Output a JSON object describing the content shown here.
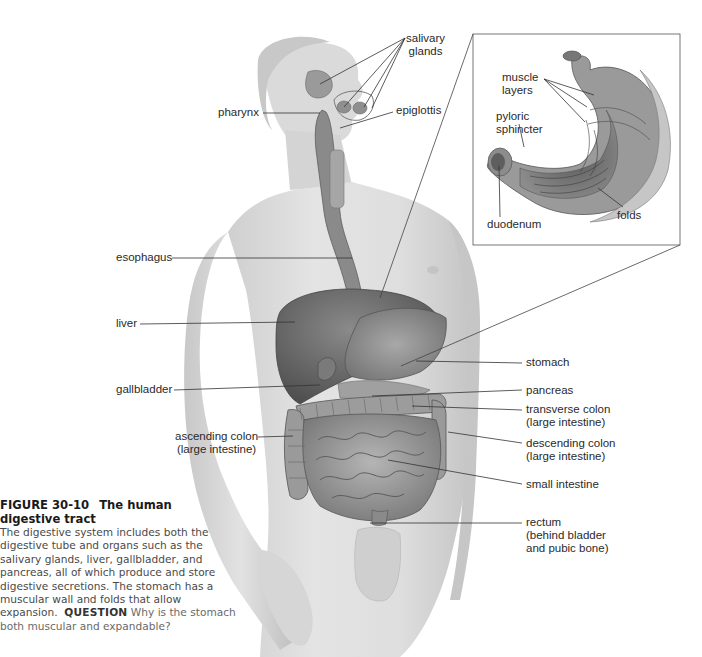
{
  "figure": {
    "number": "FIGURE 30-10",
    "title": "The human digestive tract",
    "caption_body": "The digestive system includes both the digestive tube and organs such as the salivary glands, liver, gallbladder, and pancreas, all of which produce and store digestive secretions. The stomach has a muscular wall and folds that allow expansion.",
    "question_label": "QUESTION",
    "question_text": "Why is the stomach both muscular and expandable?"
  },
  "labels": {
    "salivary_glands_1": "salivary",
    "salivary_glands_2": "glands",
    "pharynx": "pharynx",
    "epiglottis": "epiglottis",
    "esophagus": "esophagus",
    "liver": "liver",
    "gallbladder": "gallbladder",
    "ascending_colon_1": "ascending colon",
    "ascending_colon_2": "(large intestine)",
    "stomach": "stomach",
    "pancreas": "pancreas",
    "transverse_colon_1": "transverse colon",
    "transverse_colon_2": "(large intestine)",
    "descending_colon_1": "descending colon",
    "descending_colon_2": "(large intestine)",
    "small_intestine": "small intestine",
    "rectum_1": "rectum",
    "rectum_2": "(behind bladder",
    "rectum_3": "and pubic bone)"
  },
  "inset": {
    "muscle_layers_1": "muscle",
    "muscle_layers_2": "layers",
    "pyloric_sphincter_1": "pyloric",
    "pyloric_sphincter_2": "sphincter",
    "duodenum": "duodenum",
    "folds": "folds"
  }
}
